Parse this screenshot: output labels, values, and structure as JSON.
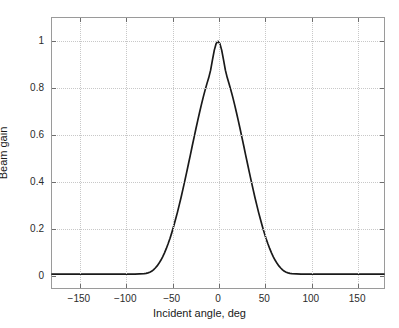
{
  "chart_data": {
    "type": "line",
    "title": "",
    "xlabel": "Incident angle, deg",
    "ylabel": "Beam gain",
    "xlim": [
      -180,
      180
    ],
    "ylim": [
      -0.06,
      1.1
    ],
    "xticks": [
      -150,
      -100,
      -50,
      0,
      50,
      100,
      150
    ],
    "xticklabels": [
      "−150",
      "−100",
      "−50",
      "0",
      "50",
      "100",
      "150"
    ],
    "yticks": [
      0,
      0.2,
      0.4,
      0.6,
      0.8,
      1
    ],
    "yticklabels": [
      "0",
      "0.2",
      "0.4",
      "0.6",
      "0.8",
      "1"
    ],
    "grid": true,
    "grid_style": "dotted",
    "legend": null,
    "line_color": "#1a1a1a",
    "line_width": 1.7,
    "series": [
      {
        "name": "Beam gain",
        "x": [
          -180,
          -170,
          -160,
          -150,
          -140,
          -130,
          -120,
          -110,
          -100,
          -95,
          -90,
          -85,
          -80,
          -78,
          -76,
          -74,
          -72,
          -70,
          -68,
          -66,
          -64,
          -62,
          -60,
          -58,
          -56,
          -54,
          -52,
          -50,
          -48,
          -46,
          -44,
          -42,
          -40,
          -38,
          -36,
          -34,
          -32,
          -30,
          -28,
          -26,
          -24,
          -22,
          -20,
          -18,
          -16,
          -14,
          -12,
          -10,
          -8,
          -6,
          -4,
          -2,
          0,
          2,
          4,
          6,
          8,
          10,
          12,
          14,
          16,
          18,
          20,
          22,
          24,
          26,
          28,
          30,
          32,
          34,
          36,
          38,
          40,
          42,
          44,
          46,
          48,
          50,
          52,
          54,
          56,
          58,
          60,
          62,
          64,
          66,
          68,
          70,
          72,
          74,
          76,
          78,
          80,
          85,
          90,
          95,
          100,
          110,
          120,
          130,
          140,
          150,
          160,
          170,
          180
        ],
        "y": [
          0,
          0,
          0,
          0,
          0,
          0,
          0,
          0,
          0,
          0,
          0,
          0.001,
          0.002,
          0.003,
          0.005,
          0.008,
          0.012,
          0.018,
          0.026,
          0.035,
          0.046,
          0.059,
          0.074,
          0.091,
          0.11,
          0.131,
          0.154,
          0.179,
          0.206,
          0.235,
          0.265,
          0.297,
          0.33,
          0.365,
          0.4,
          0.437,
          0.474,
          0.511,
          0.549,
          0.586,
          0.623,
          0.659,
          0.694,
          0.728,
          0.76,
          0.79,
          0.818,
          0.844,
          0.876,
          0.92,
          0.962,
          0.99,
          1.0,
          0.99,
          0.962,
          0.92,
          0.876,
          0.844,
          0.818,
          0.79,
          0.76,
          0.728,
          0.694,
          0.659,
          0.623,
          0.586,
          0.549,
          0.511,
          0.474,
          0.437,
          0.4,
          0.365,
          0.33,
          0.297,
          0.265,
          0.235,
          0.206,
          0.179,
          0.154,
          0.131,
          0.11,
          0.091,
          0.074,
          0.059,
          0.046,
          0.035,
          0.026,
          0.018,
          0.012,
          0.008,
          0.005,
          0.003,
          0.002,
          0.001,
          0,
          0,
          0,
          0,
          0,
          0,
          0,
          0,
          0,
          0,
          0
        ]
      }
    ],
    "peak": {
      "x": 0,
      "y": 1
    },
    "annotations": []
  }
}
